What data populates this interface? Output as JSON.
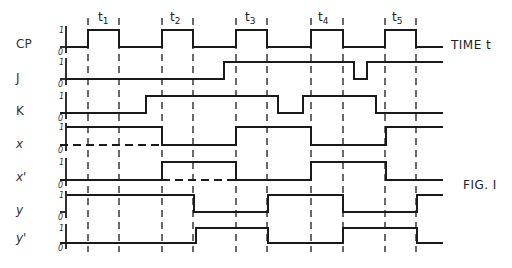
{
  "figure": {
    "caption": "FIG. I",
    "time_label": "TIME t",
    "stroke_color": "#1a1a1a",
    "axis_x": 66,
    "line_end_x": 443
  },
  "clock_edges_x": [
    88,
    119,
    162,
    193,
    236,
    267,
    311,
    343,
    385,
    416
  ],
  "periods": [
    {
      "label": "t1",
      "base": "t",
      "sub": "1",
      "x": 98
    },
    {
      "label": "t2",
      "base": "t",
      "sub": "2",
      "x": 170
    },
    {
      "label": "t3",
      "base": "t",
      "sub": "3",
      "x": 245
    },
    {
      "label": "t4",
      "base": "t",
      "sub": "4",
      "x": 318
    },
    {
      "label": "t5",
      "base": "t",
      "sub": "5",
      "x": 392
    }
  ],
  "signals": [
    {
      "name": "CP",
      "label_y": 46,
      "high_y": 30,
      "low_y": 47,
      "steps": [
        [
          66,
          "L"
        ],
        [
          88,
          "H"
        ],
        [
          119,
          "L"
        ],
        [
          162,
          "H"
        ],
        [
          193,
          "L"
        ],
        [
          236,
          "H"
        ],
        [
          267,
          "L"
        ],
        [
          311,
          "H"
        ],
        [
          343,
          "L"
        ],
        [
          385,
          "H"
        ],
        [
          416,
          "L"
        ],
        [
          443,
          "L"
        ]
      ],
      "dashed": []
    },
    {
      "name": "J",
      "label_y": 80,
      "high_y": 62,
      "low_y": 79,
      "steps": [
        [
          66,
          "L"
        ],
        [
          224,
          "H"
        ],
        [
          354,
          "L"
        ],
        [
          367,
          "H"
        ],
        [
          443,
          "H"
        ]
      ],
      "dashed": []
    },
    {
      "name": "K",
      "label_y": 113,
      "high_y": 96,
      "low_y": 113,
      "steps": [
        [
          60,
          "L"
        ],
        [
          146,
          "H"
        ],
        [
          278,
          "L"
        ],
        [
          303,
          "H"
        ],
        [
          376,
          "L"
        ],
        [
          443,
          "L"
        ]
      ],
      "dashed": []
    },
    {
      "name": "x",
      "label_y": 146,
      "high_y": 127,
      "low_y": 145,
      "steps": [
        [
          66,
          "H"
        ],
        [
          162,
          "L"
        ],
        [
          236,
          "H"
        ],
        [
          311,
          "L"
        ],
        [
          386,
          "H"
        ],
        [
          443,
          "H"
        ]
      ],
      "dashed": [
        [
          60,
          162
        ]
      ]
    },
    {
      "name": "x'",
      "label_y": 179,
      "high_y": 162,
      "low_y": 180,
      "steps": [
        [
          60,
          "L"
        ],
        [
          162,
          "H"
        ],
        [
          236,
          "L"
        ],
        [
          311,
          "H"
        ],
        [
          386,
          "L"
        ],
        [
          443,
          "L"
        ]
      ],
      "dashed": [
        [
          162,
          236
        ]
      ]
    },
    {
      "name": "y",
      "label_y": 212,
      "high_y": 195,
      "low_y": 212,
      "steps": [
        [
          67,
          "H"
        ],
        [
          194,
          "L"
        ],
        [
          268,
          "H"
        ],
        [
          343,
          "L"
        ],
        [
          417,
          "H"
        ],
        [
          443,
          "H"
        ]
      ],
      "dashed": []
    },
    {
      "name": "y'",
      "label_y": 240,
      "high_y": 228,
      "low_y": 243,
      "steps": [
        [
          60,
          "L"
        ],
        [
          196,
          "H"
        ],
        [
          268,
          "L"
        ],
        [
          343,
          "H"
        ],
        [
          417,
          "L"
        ],
        [
          443,
          "L"
        ]
      ],
      "dashed": []
    }
  ],
  "level_labels": {
    "one": "1",
    "zero": "0"
  }
}
